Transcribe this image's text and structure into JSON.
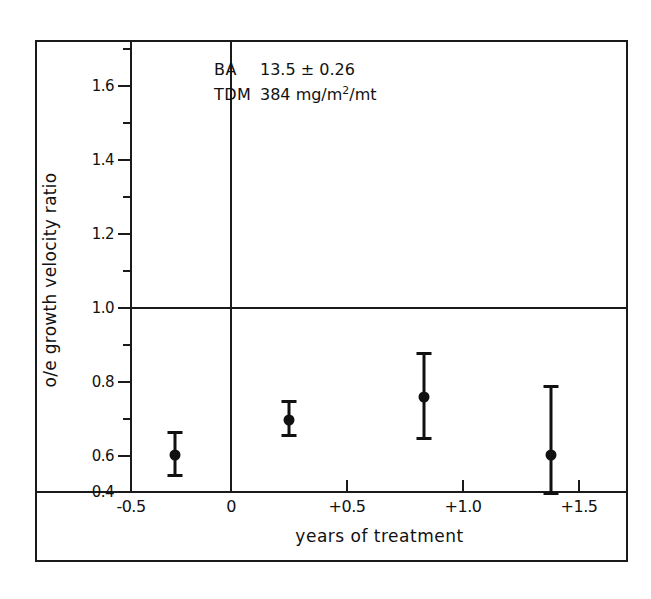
{
  "chart_data": {
    "type": "scatter",
    "title": "",
    "xlabel": "years of treatment",
    "ylabel": "o/e growth velocity ratio",
    "xlim": [
      -0.5,
      1.65
    ],
    "ylim": [
      0.37,
      1.73
    ],
    "grid": false,
    "legend": null,
    "reference_lines": [
      {
        "axis": "y",
        "value": 1.0
      },
      {
        "axis": "x",
        "value": 0.0
      }
    ],
    "x_ticks": [
      -0.5,
      0,
      0.5,
      1.0,
      1.5
    ],
    "x_tick_labels": [
      "-0.5",
      "0",
      "+0.5",
      "+1.0",
      "+1.5"
    ],
    "y_ticks": [
      0.4,
      0.6,
      0.8,
      1.0,
      1.2,
      1.4,
      1.6
    ],
    "y_tick_labels": [
      "0.4",
      "0.6",
      "0.8",
      "1.0",
      "1.2",
      "1.4",
      "1.6"
    ],
    "y_minor_ticks": [
      0.5,
      0.7,
      0.9,
      1.1,
      1.3,
      1.5
    ],
    "series": [
      {
        "name": "o/e growth velocity ratio",
        "marker": "filled-circle",
        "errorbars": true,
        "points": [
          {
            "x": -0.24,
            "y": 0.52,
            "y_low": 0.45,
            "y_high": 0.6
          },
          {
            "x": 0.25,
            "y": 0.635,
            "y_low": 0.58,
            "y_high": 0.7
          },
          {
            "x": 0.83,
            "y": 0.71,
            "y_low": 0.57,
            "y_high": 0.855
          },
          {
            "x": 1.38,
            "y": 0.52,
            "y_low": 0.39,
            "y_high": 0.75
          }
        ]
      }
    ],
    "annotations": [
      {
        "label": "BA",
        "value": "13.5 ± 0.26"
      },
      {
        "label": "TDM",
        "value": "384 mg/m²/mt"
      }
    ]
  },
  "annotation": {
    "ba_label": "BA",
    "ba_value": "13.5 ± 0.26",
    "tdm_label": "TDM",
    "tdm_value_pre": "384 mg/m",
    "tdm_value_sup": "2",
    "tdm_value_post": "/mt"
  },
  "axes": {
    "x_title": "years of treatment",
    "y_title": "o/e growth velocity ratio",
    "x_labels": [
      "-0.5",
      "0",
      "+0.5",
      "+1.0",
      "+1.5"
    ],
    "y_labels": [
      "1.6",
      "1.4",
      "1.2",
      "1.0",
      "0.8",
      "0.6",
      "0.4"
    ]
  },
  "colors": {
    "ink": "#111111",
    "frame": "#1a1a1a",
    "background": "#ffffff"
  }
}
